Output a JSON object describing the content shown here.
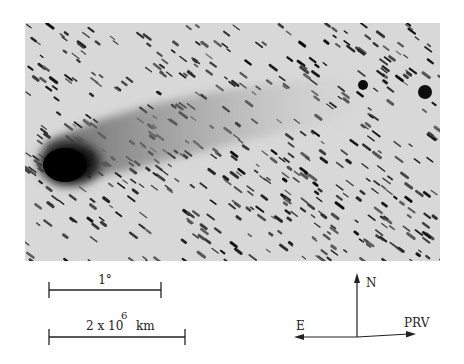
{
  "image": {
    "subject": "comet with dust tail against trailed star field",
    "style": "negative (inverted) grayscale astronomical photograph"
  },
  "scale_bars": {
    "angular": {
      "label": "1°"
    },
    "linear": {
      "label_mantissa": "2 x 10",
      "label_exponent": "6",
      "label_unit": "km"
    }
  },
  "compass": {
    "north": "N",
    "east": "E",
    "prv": "PRV"
  },
  "colors": {
    "sky": "#d9d9d9",
    "ink": "#111111"
  }
}
